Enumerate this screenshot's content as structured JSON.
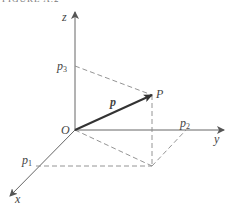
{
  "figure": {
    "title": "FIGURE A.2",
    "labels": {
      "z": "z",
      "y": "y",
      "x": "x",
      "origin": "O",
      "p1": "p",
      "p1_sub": "1",
      "p2": "p",
      "p2_sub": "2",
      "p3": "p",
      "p3_sub": "3",
      "point": "P",
      "vector": "p"
    },
    "colors": {
      "axis": "#666666",
      "vector": "#333333",
      "dashed": "#888888",
      "text": "#444444"
    }
  }
}
